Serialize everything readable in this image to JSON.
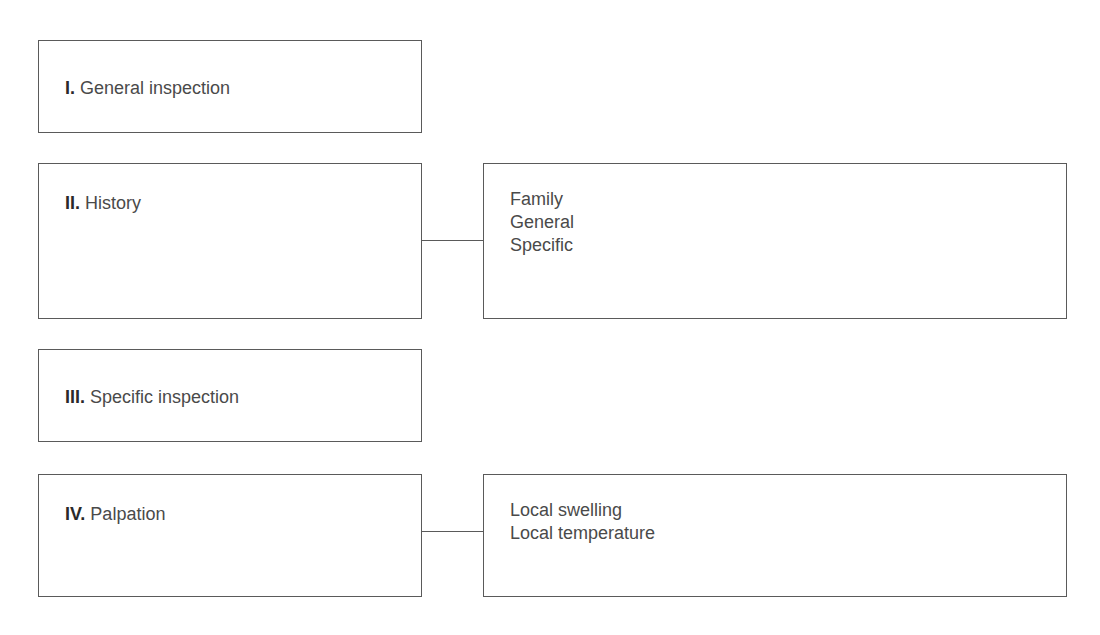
{
  "diagram": {
    "steps": [
      {
        "numeral": "I.",
        "title": "General inspection",
        "details": []
      },
      {
        "numeral": "II.",
        "title": "History",
        "details": [
          "Family",
          "General",
          "Specific"
        ]
      },
      {
        "numeral": "III.",
        "title": "Specific inspection",
        "details": []
      },
      {
        "numeral": "IV.",
        "title": "Palpation",
        "details": [
          "Local swelling",
          "Local temperature"
        ]
      }
    ],
    "colors": {
      "border": "#5a5a5a",
      "text": "#4a4a4a",
      "numeral": "#2a2a2a",
      "background": "#ffffff"
    }
  }
}
